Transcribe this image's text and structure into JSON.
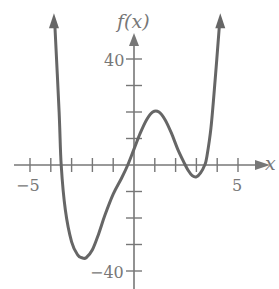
{
  "chart_data": {
    "type": "line",
    "title": "",
    "xlabel": "x",
    "ylabel": "f(x)",
    "xlim": [
      -5.8,
      6.2
    ],
    "ylim": [
      -44,
      52
    ],
    "x_ticks": [
      -5,
      -4,
      -3,
      -2,
      -1,
      0,
      1,
      2,
      3,
      4,
      5
    ],
    "x_tick_labels": {
      "-5": "−5",
      "5": "5"
    },
    "y_ticks": [
      -40,
      -30,
      -20,
      -10,
      0,
      10,
      20,
      30,
      40
    ],
    "y_tick_labels": {
      "40": "40",
      "-40": "−40"
    },
    "grid": false,
    "series": [
      {
        "name": "f(x)",
        "color": "#666666",
        "x": [
          -3.8,
          -3.6,
          -3.5,
          -3.3,
          -3.0,
          -2.7,
          -2.5,
          -2.3,
          -2.0,
          -1.7,
          -1.4,
          -1.0,
          -0.6,
          -0.3,
          0,
          0.3,
          0.6,
          0.9,
          1.2,
          1.5,
          1.8,
          2.1,
          2.4,
          2.6,
          2.8,
          3.0,
          3.2,
          3.4,
          3.5,
          3.7,
          3.9,
          4.1
        ],
        "y": [
          52,
          20,
          0,
          -17,
          -29,
          -34,
          -35,
          -35,
          -32,
          -26,
          -19,
          -11,
          -5,
          0,
          6,
          12,
          17,
          20,
          20,
          17,
          12,
          6,
          1,
          -2,
          -4,
          -4.5,
          -3,
          0,
          3,
          14,
          32,
          52
        ]
      }
    ],
    "features": {
      "local_min_left": {
        "x": -2.3,
        "y": -35
      },
      "local_max": {
        "x": 0.9,
        "y": 21
      },
      "local_min_right": {
        "x": 3.0,
        "y": -4.5
      },
      "roots": [
        -3.5,
        -0.3,
        2.4,
        3.4
      ]
    }
  },
  "labels": {
    "y_axis": "f(x)",
    "x_axis": "x",
    "x_neg5": "−5",
    "x_pos5": "5",
    "y_40": "40",
    "y_neg40": "−40"
  }
}
